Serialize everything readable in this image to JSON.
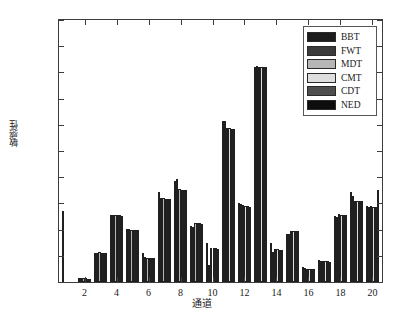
{
  "chart_data": {
    "type": "bar",
    "title": "",
    "xlabel": "通道",
    "ylabel": "敏感性",
    "xlim": [
      0.4,
      20.6
    ],
    "ylim": [
      0,
      0.02
    ],
    "grid": false,
    "legend_position": "top-right",
    "x_tick_labels": [
      "2",
      "4",
      "6",
      "8",
      "10",
      "12",
      "14",
      "16",
      "18",
      "20"
    ],
    "x_tick_values": [
      2,
      4,
      6,
      8,
      10,
      12,
      14,
      16,
      18,
      20
    ],
    "y_tick_labels": [
      "0",
      "0.002",
      "0.004",
      "0.006",
      "0.008",
      "0.010",
      "0.012",
      "0.014",
      "0.016",
      "0.018",
      "0.020"
    ],
    "y_tick_values": [
      0,
      0.002,
      0.004,
      0.006,
      0.008,
      0.01,
      0.012,
      0.014,
      0.016,
      0.018,
      0.02
    ],
    "categories": [
      1,
      2,
      3,
      4,
      5,
      6,
      7,
      8,
      9,
      10,
      11,
      12,
      13,
      14,
      15,
      16,
      17,
      18,
      19,
      20
    ],
    "series": [
      {
        "name": "BBT",
        "color": "#1c1c1c",
        "values": [
          0.0054,
          0.00032,
          0.00224,
          0.00512,
          0.00405,
          0.00222,
          0.00686,
          0.0077,
          0.00425,
          0.00297,
          0.01228,
          0.00601,
          0.01641,
          0.00295,
          0.00367,
          0.00118,
          0.00168,
          0.00507,
          0.00684,
          0.00582
        ]
      },
      {
        "name": "FWT",
        "color": "#3a3a3a",
        "values": [
          0.0,
          0.0003,
          0.00224,
          0.00508,
          0.00402,
          0.00188,
          0.0064,
          0.00784,
          0.00421,
          0.00131,
          0.01231,
          0.00597,
          0.01646,
          0.00232,
          0.00368,
          0.0011,
          0.00163,
          0.005,
          0.00658,
          0.00576
        ]
      },
      {
        "name": "MDT",
        "color": "#b6b6b6",
        "values": [
          0.0,
          0.00029,
          0.00226,
          0.00509,
          0.004,
          0.00187,
          0.00639,
          0.00707,
          0.00448,
          0.00262,
          0.01174,
          0.00585,
          0.01643,
          0.00253,
          0.00387,
          0.00103,
          0.0016,
          0.00516,
          0.00622,
          0.00578
        ]
      },
      {
        "name": "CMT",
        "color": "#dedede",
        "values": [
          0.0,
          0.00028,
          0.00224,
          0.00509,
          0.00398,
          0.00186,
          0.00637,
          0.00705,
          0.00449,
          0.0026,
          0.01172,
          0.00583,
          0.0164,
          0.00251,
          0.0039,
          0.00101,
          0.00159,
          0.00514,
          0.0062,
          0.00576
        ]
      },
      {
        "name": "CDT",
        "color": "#4e4e4e",
        "values": [
          0.0,
          0.00026,
          0.00222,
          0.00508,
          0.00397,
          0.00184,
          0.00636,
          0.00703,
          0.00447,
          0.00256,
          0.0117,
          0.00578,
          0.01645,
          0.00248,
          0.00392,
          0.001,
          0.00157,
          0.00512,
          0.00617,
          0.00574
        ]
      },
      {
        "name": "NED",
        "color": "#0d0d0d",
        "values": [
          0.0,
          0.00025,
          0.00223,
          0.00507,
          0.00396,
          0.00183,
          0.00635,
          0.00701,
          0.00445,
          0.00254,
          0.01168,
          0.00575,
          0.01642,
          0.00246,
          0.00388,
          0.00099,
          0.00156,
          0.0051,
          0.00615,
          0.007
        ]
      }
    ]
  },
  "legend": {
    "items": [
      {
        "label": "BBT"
      },
      {
        "label": "FWT"
      },
      {
        "label": "MDT"
      },
      {
        "label": "CMT"
      },
      {
        "label": "CDT"
      },
      {
        "label": "NED"
      }
    ]
  },
  "axis": {
    "x_title": "通道",
    "y_title": "敏感性"
  }
}
